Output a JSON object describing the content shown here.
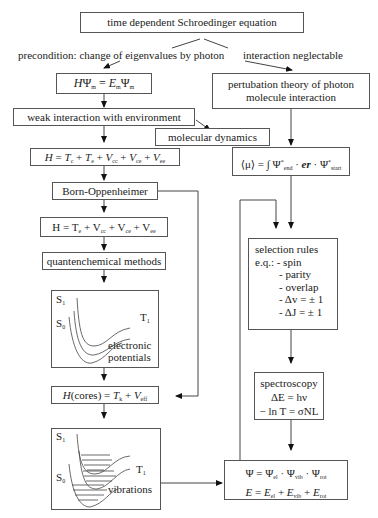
{
  "nodes": {
    "schroedinger": "time dependent Schroedinger equation",
    "precondition": "precondition: change of eigenvalues by photon",
    "interaction_neglectable": "interaction neglectable",
    "eigen_eq": {
      "H": "H",
      "Psi": "Ψ",
      "m": "m",
      "eq": " = ",
      "E": "E"
    },
    "weak_interaction": "weak interaction with environment",
    "molecular_dynamics": "molecular dynamics",
    "perturbation_line1": "pertubation theory of photon",
    "perturbation_line2": "molecule interaction",
    "hamiltonian_full": {
      "H": "H",
      "terms": [
        {
          "sym": "T",
          "sub": "c"
        },
        {
          "sym": "T",
          "sub": "e"
        },
        {
          "sym": "V",
          "sub": "cc"
        },
        {
          "sym": "V",
          "sub": "ce"
        },
        {
          "sym": "V",
          "sub": "ee"
        }
      ]
    },
    "born_oppenheimer": "Born-Oppenheimer",
    "hamiltonian_el": {
      "H": "H",
      "terms": [
        {
          "sym": "T",
          "sub": "e"
        },
        {
          "sym": "V",
          "sub": "cc"
        },
        {
          "sym": "V",
          "sub": "ce"
        },
        {
          "sym": "V",
          "sub": "ee"
        }
      ]
    },
    "quantum_methods": "quantenchemical methods",
    "electronic_potentials": {
      "S1": "S",
      "S1_sub": "1",
      "S0": "S",
      "S0_sub": "0",
      "T1": "T",
      "T1_sub": "1",
      "label1": "electronic",
      "label2": "potentials"
    },
    "hamiltonian_cores": {
      "lhs": "H",
      "arg": "(cores)",
      "T": "T",
      "T_sub": "k",
      "V": "V",
      "V_sub": "eff"
    },
    "vibrations": {
      "S1": "S",
      "S1_sub": "1",
      "S0": "S",
      "S0_sub": "0",
      "T1": "T",
      "T1_sub": "1",
      "label": "vibrations"
    },
    "expectation": {
      "mu": "⟨μ⟩ = ∫ Ψ",
      "end": "end",
      "er": "er",
      "start": "start"
    },
    "selection_rules": {
      "title": "selection rules",
      "items": [
        "e.q.: - spin",
        "- parity",
        "- overlap",
        "- Δv = ± 1",
        "- ΔJ = ± 1"
      ]
    },
    "spectroscopy": {
      "title": "spectroscopy",
      "eq1": "ΔE = hν",
      "eq2": "− ln T = σNL"
    },
    "total_wave": {
      "eq1": "Ψ = Ψ",
      "el": "el",
      "vib": "vib",
      "rot": "rot",
      "E": "E"
    }
  }
}
